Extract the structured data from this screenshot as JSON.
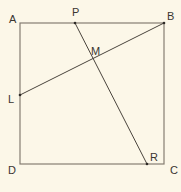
{
  "diagram": {
    "type": "geometry",
    "shape": "square ABCD",
    "colors": {
      "background": "#fcf7e8",
      "square": "#857d72",
      "segments": "#4a443d",
      "labels": "#3a3530"
    },
    "points": {
      "A": {
        "label": "A",
        "x": 20,
        "y": 23
      },
      "B": {
        "label": "B",
        "x": 164,
        "y": 23
      },
      "C": {
        "label": "C",
        "x": 164,
        "y": 164
      },
      "D": {
        "label": "D",
        "x": 20,
        "y": 164
      },
      "P": {
        "label": "P",
        "x": 75,
        "y": 23
      },
      "R": {
        "label": "R",
        "x": 147,
        "y": 164
      },
      "L": {
        "label": "L",
        "x": 20,
        "y": 95
      },
      "M": {
        "label": "M",
        "x": 92,
        "y": 59
      }
    },
    "segments": [
      "BL",
      "PR"
    ],
    "labels": {
      "A": "A",
      "B": "B",
      "C": "C",
      "D": "D",
      "P": "P",
      "R": "R",
      "L": "L",
      "M": "M"
    }
  }
}
